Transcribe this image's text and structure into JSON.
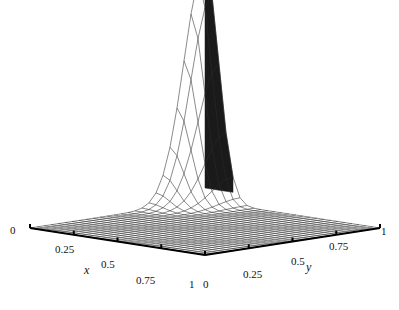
{
  "figure": {
    "background_color": "#ffffff",
    "mesh_color": "#2b2b2b",
    "axis_color": "#000000",
    "fill_light": "#f2f2f2",
    "fill_dark": "#1a1a1a"
  },
  "axes": {
    "x": {
      "name": "x",
      "ticks": [
        "0",
        "0.25",
        "0.5",
        "0.75",
        "1"
      ],
      "tick_values": [
        0,
        0.25,
        0.5,
        0.75,
        1
      ],
      "range": [
        0,
        1
      ]
    },
    "y": {
      "name": "y",
      "ticks": [
        "0",
        "0.25",
        "0.5",
        "0.75",
        "1"
      ],
      "tick_values": [
        0,
        0.25,
        0.5,
        0.75,
        1
      ],
      "range": [
        0,
        1
      ]
    },
    "z": {
      "name": "",
      "ticks": [],
      "range": [
        0,
        1
      ]
    }
  },
  "chart_data": {
    "type": "surface",
    "title": "",
    "xlabel": "x",
    "ylabel": "y",
    "zlabel": "",
    "xlim": [
      0,
      1
    ],
    "ylim": [
      0,
      1
    ],
    "zlim": [
      0,
      1
    ],
    "grid": true,
    "legend": "none",
    "projection": {
      "type": "oblique-axonometric",
      "origin_px": [
        205,
        255
      ],
      "x_axis_px": [
        30,
        228
      ],
      "y_axis_px": [
        380,
        228
      ],
      "z_height_px": 236
    },
    "mesh": {
      "nx": 25,
      "ny": 25,
      "peak_x": 1.0,
      "peak_y": 1.0,
      "peak_z": 1.0,
      "decay_x": 0.11,
      "decay_y": 0.17
    },
    "surface_samples": {
      "x": [
        0,
        0.25,
        0.5,
        0.75,
        0.875,
        0.95,
        1
      ],
      "y": [
        0,
        0.25,
        0.5,
        0.75,
        0.875,
        0.95,
        1
      ],
      "z": [
        [
          0.0,
          0.0,
          0.0,
          0.0,
          0.0,
          0.0,
          0.0
        ],
        [
          0.0,
          0.0,
          0.0,
          0.0,
          0.0,
          0.0,
          0.01
        ],
        [
          0.0,
          0.0,
          0.0,
          0.0,
          0.01,
          0.01,
          0.02
        ],
        [
          0.0,
          0.0,
          0.0,
          0.01,
          0.03,
          0.06,
          0.09
        ],
        [
          0.0,
          0.0,
          0.01,
          0.03,
          0.1,
          0.2,
          0.29
        ],
        [
          0.0,
          0.0,
          0.01,
          0.06,
          0.2,
          0.48,
          0.68
        ],
        [
          0.0,
          0.01,
          0.02,
          0.09,
          0.29,
          0.68,
          1.0
        ]
      ]
    }
  },
  "tick_labels": {
    "x": [
      {
        "text": "0",
        "left": 10,
        "top": 224
      },
      {
        "text": "0.25",
        "left": 55,
        "top": 243
      },
      {
        "text": "0.5",
        "left": 101,
        "top": 258
      },
      {
        "text": "0.75",
        "left": 136,
        "top": 274
      },
      {
        "text": "1",
        "left": 189,
        "top": 278
      }
    ],
    "y": [
      {
        "text": "0",
        "left": 203,
        "top": 278
      },
      {
        "text": "0.25",
        "left": 243,
        "top": 268
      },
      {
        "text": "0.5",
        "left": 291,
        "top": 255
      },
      {
        "text": "0.75",
        "left": 329,
        "top": 240
      },
      {
        "text": "1",
        "left": 381,
        "top": 225
      }
    ]
  },
  "axis_names": [
    {
      "text": "x",
      "left": 84,
      "top": 263
    },
    {
      "text": "y",
      "left": 306,
      "top": 260
    }
  ]
}
